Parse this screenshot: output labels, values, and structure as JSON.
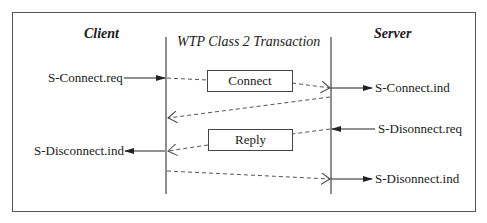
{
  "diagram": {
    "type": "sequence",
    "title": "WTP Class 2 Transaction",
    "participants": {
      "left": "Client",
      "right": "Server"
    },
    "messages": [
      {
        "label": "Connect",
        "from": "Client",
        "to": "Server",
        "style": "dashed"
      },
      {
        "label": "",
        "from": "Server",
        "to": "Client",
        "style": "dashed"
      },
      {
        "label": "Reply",
        "from": "Server",
        "to": "Client",
        "style": "dashed"
      },
      {
        "label": "",
        "from": "Client",
        "to": "Server",
        "style": "dashed"
      }
    ],
    "primitives": {
      "client_connect_req": "S-Connect.req",
      "server_connect_ind": "S-Connect.ind",
      "server_disconnect_req": "S-Disonnect.req",
      "client_disconnect_ind": "S-Disconnect.ind",
      "server_disconnect_ind": "S-Disonnect.ind"
    },
    "colors": {
      "line": "#333333",
      "frame": "#555555",
      "background": "#ffffff"
    }
  }
}
